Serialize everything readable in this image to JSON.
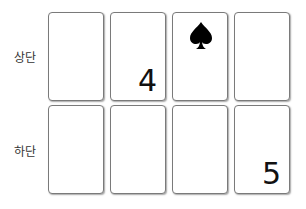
{
  "rows": [
    {
      "label": "상단",
      "cards": [
        {
          "content": ""
        },
        {
          "content": "4",
          "type": "number"
        },
        {
          "content": "spade-icon",
          "type": "icon"
        },
        {
          "content": ""
        }
      ]
    },
    {
      "label": "하단",
      "cards": [
        {
          "content": ""
        },
        {
          "content": ""
        },
        {
          "content": ""
        },
        {
          "content": "5",
          "type": "number"
        }
      ]
    }
  ]
}
